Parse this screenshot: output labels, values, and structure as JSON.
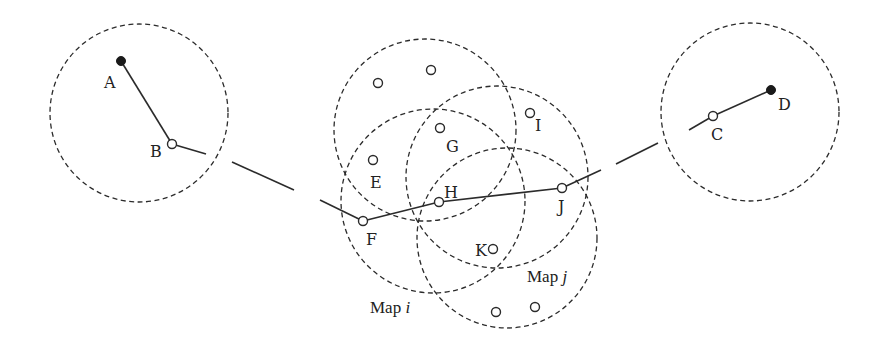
{
  "diagram": {
    "colors": {
      "stroke": "#2b2b2b",
      "background": "#ffffff"
    },
    "circles": [
      {
        "id": "left",
        "cx": 139,
        "cy": 113,
        "r": 89
      },
      {
        "id": "top",
        "cx": 425,
        "cy": 130,
        "r": 91
      },
      {
        "id": "map-i",
        "cx": 433,
        "cy": 201,
        "r": 92
      },
      {
        "id": "upper-right",
        "cx": 497,
        "cy": 177,
        "r": 91
      },
      {
        "id": "map-j",
        "cx": 507,
        "cy": 238,
        "r": 90
      },
      {
        "id": "right",
        "cx": 750,
        "cy": 112,
        "r": 89
      }
    ],
    "nodes": {
      "A": {
        "label": "A",
        "x": 121,
        "y": 61,
        "type": "filled"
      },
      "B": {
        "label": "B",
        "x": 172,
        "y": 144,
        "type": "open"
      },
      "C": {
        "label": "C",
        "x": 713,
        "y": 116,
        "type": "open"
      },
      "D": {
        "label": "D",
        "x": 771,
        "y": 90,
        "type": "filled"
      },
      "E": {
        "label": "E",
        "x": 373,
        "y": 160,
        "type": "open"
      },
      "F": {
        "label": "F",
        "x": 363,
        "y": 221,
        "type": "open"
      },
      "G": {
        "label": "G",
        "x": 440,
        "y": 128,
        "type": "open"
      },
      "H": {
        "label": "H",
        "x": 439,
        "y": 202,
        "type": "open"
      },
      "I": {
        "label": "I",
        "x": 530,
        "y": 113,
        "type": "open"
      },
      "J": {
        "label": "J",
        "x": 562,
        "y": 188,
        "type": "open"
      },
      "K": {
        "label": "K",
        "x": 493,
        "y": 249,
        "type": "open"
      }
    },
    "unlabeled_nodes": [
      {
        "x": 378,
        "y": 83
      },
      {
        "x": 431,
        "y": 70
      },
      {
        "x": 496,
        "y": 312
      },
      {
        "x": 535,
        "y": 307
      }
    ],
    "map_labels": {
      "map_i": {
        "prefix": "Map ",
        "var": "i"
      },
      "map_j": {
        "prefix": "Map ",
        "var": "j"
      }
    }
  }
}
